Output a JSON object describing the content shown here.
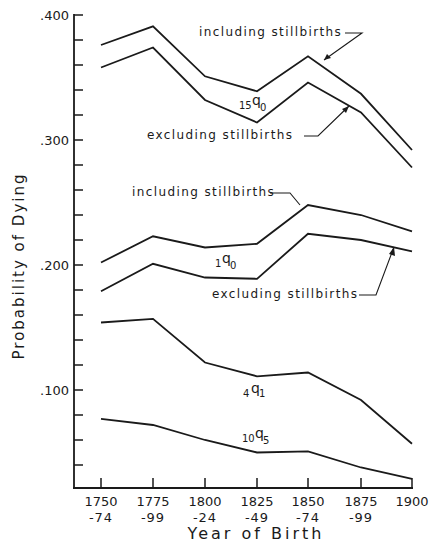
{
  "chart_data": {
    "type": "line",
    "title": "",
    "xlabel": "Year of Birth",
    "ylabel": "Probability of Dying",
    "categories": [
      "1750-74",
      "1775-99",
      "1800-24",
      "1825-49",
      "1850-74",
      "1875-99",
      "1900"
    ],
    "x_tick_labels": [
      {
        "top": "1750",
        "bottom": "-74"
      },
      {
        "top": "1775",
        "bottom": "-99"
      },
      {
        "top": "1800",
        "bottom": "-24"
      },
      {
        "top": "1825",
        "bottom": "-49"
      },
      {
        "top": "1850",
        "bottom": "-74"
      },
      {
        "top": "1875",
        "bottom": "-99"
      },
      {
        "top": "1900",
        "bottom": ""
      }
    ],
    "y_tick_labels": [
      ".400",
      ".300",
      ".200",
      ".100"
    ],
    "y_major_ticks": [
      0.4,
      0.3,
      0.2,
      0.1
    ],
    "y_minor_step": 0.02,
    "ylim": [
      0.021,
      0.4
    ],
    "grid": false,
    "legend": "none (inline labels)",
    "series": [
      {
        "name": "15q0 including stillbirths",
        "values": [
          0.376,
          0.391,
          0.351,
          0.339,
          0.367,
          0.337,
          0.292
        ]
      },
      {
        "name": "15q0 excluding stillbirths",
        "values": [
          0.358,
          0.374,
          0.332,
          0.314,
          0.346,
          0.322,
          0.278
        ]
      },
      {
        "name": "1q0 including stillbirths",
        "values": [
          0.202,
          0.223,
          0.214,
          0.217,
          0.248,
          0.24,
          0.227
        ]
      },
      {
        "name": "1q0 excluding stillbirths",
        "values": [
          0.179,
          0.201,
          0.19,
          0.189,
          0.225,
          0.22,
          0.211
        ]
      },
      {
        "name": "4q1",
        "values": [
          0.154,
          0.157,
          0.122,
          0.111,
          0.114,
          0.092,
          0.057
        ]
      },
      {
        "name": "10q5",
        "values": [
          0.077,
          0.072,
          0.06,
          0.05,
          0.051,
          0.038,
          0.029
        ]
      }
    ],
    "annotations": [
      {
        "text": "including stillbirths",
        "target": "15q0 including stillbirths"
      },
      {
        "text": "excluding stillbirths",
        "target": "15q0 excluding stillbirths"
      },
      {
        "text": "including stillbirths",
        "target": "1q0 including stillbirths"
      },
      {
        "text": "excluding stillbirths",
        "target": "1q0 excluding stillbirths"
      },
      {
        "text": "15q0",
        "sub_left": "15",
        "main": "q",
        "sub_right": "0"
      },
      {
        "text": "1q0",
        "sub_left": "1",
        "main": "q",
        "sub_right": "0"
      },
      {
        "text": "4q1",
        "sub_left": "4",
        "main": "q",
        "sub_right": "1"
      },
      {
        "text": "10q5",
        "sub_left": "10",
        "main": "q",
        "sub_right": "5"
      }
    ]
  },
  "labels": {
    "upper_including": "including stillbirths",
    "upper_excluding": "excluding stillbirths",
    "mid_including": "including stillbirths",
    "mid_excluding": "excluding stillbirths",
    "q15_0": {
      "left": "15",
      "main": "q",
      "right": "0"
    },
    "q1_0": {
      "left": "1",
      "main": "q",
      "right": "0"
    },
    "q4_1": {
      "left": "4",
      "main": "q",
      "right": "1"
    },
    "q10_5": {
      "left": "10",
      "main": "q",
      "right": "5"
    }
  }
}
